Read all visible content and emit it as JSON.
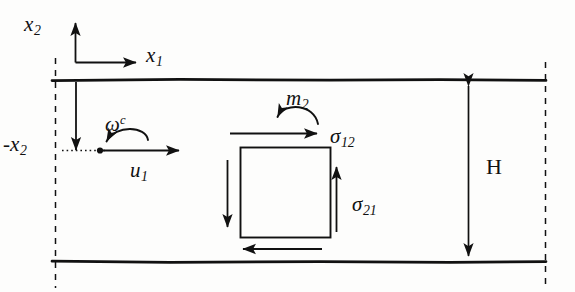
{
  "figure": {
    "kind": "schematic-diagram",
    "background_color": "#fdfdfc",
    "ink_color": "#111111"
  },
  "labels": {
    "axis_x2": {
      "base": "x",
      "sub": "2"
    },
    "axis_x1": {
      "base": "x",
      "sub": "1"
    },
    "neg_x2": {
      "base": "-x",
      "sub": "2"
    },
    "omega_c": {
      "base": "ω",
      "sup": "c"
    },
    "u1": {
      "base": "u",
      "sub": "1"
    },
    "m2": {
      "base": "m",
      "sub": "2"
    },
    "sigma12": {
      "base": "σ",
      "sub": "12"
    },
    "sigma21": {
      "base": "σ",
      "sub": "21"
    },
    "height_H": {
      "base": "H"
    }
  },
  "geometry": {
    "channel": {
      "top_wall_y": 80,
      "bottom_wall_y": 262,
      "left_x": 52,
      "right_x": 546,
      "wall_stroke_width": 2.6
    },
    "dashed_boundaries": [
      {
        "name": "left-dashed-boundary",
        "x": 55,
        "y1": 58,
        "y2": 288
      },
      {
        "name": "right-dashed-boundary",
        "x": 546,
        "y1": 62,
        "y2": 290
      }
    ],
    "coordinate_axes": {
      "origin_x": 75,
      "origin_y": 62,
      "x2_arrow_tip_y": 22,
      "x1_arrow_tip_x": 137
    },
    "centerline": {
      "y": 150,
      "dotted_from_x": 62,
      "dotted_to_x": 104,
      "dot_x": 100,
      "solid_arrow_tip_x": 180
    },
    "drop_arrow": {
      "x": 76,
      "y1": 82,
      "y2": 152
    },
    "element_square": {
      "x": 240,
      "y": 147,
      "width": 90,
      "height": 90
    },
    "element_arrows": {
      "top": {
        "x1": 230,
        "x2": 318,
        "y": 133,
        "direction": "right"
      },
      "right": {
        "x": 336,
        "y1": 232,
        "y2": 166,
        "direction": "up"
      },
      "left": {
        "x": 227,
        "y1": 160,
        "y2": 228,
        "direction": "down"
      },
      "bottom": {
        "x1": 322,
        "x2": 242,
        "y": 249,
        "direction": "left"
      }
    },
    "dimension_H": {
      "x": 468,
      "y_top": 80,
      "y_bottom": 262
    }
  },
  "label_positions": {
    "axis_x2": {
      "x": 24,
      "y": 14
    },
    "axis_x1": {
      "x": 146,
      "y": 45
    },
    "neg_x2": {
      "x": 3,
      "y": 134
    },
    "omega_c": {
      "x": 105,
      "y": 114
    },
    "u1": {
      "x": 130,
      "y": 160
    },
    "m2": {
      "x": 286,
      "y": 88
    },
    "sigma12": {
      "x": 330,
      "y": 126
    },
    "sigma21": {
      "x": 352,
      "y": 194
    },
    "height_H": {
      "x": 486,
      "y": 156
    }
  }
}
